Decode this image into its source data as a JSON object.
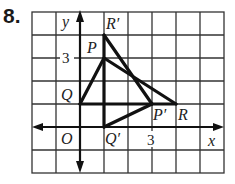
{
  "problem": {
    "number": "8."
  },
  "grid": {
    "x_min": -2,
    "x_max": 6,
    "y_min": -2,
    "y_max": 5,
    "origin_px": [
      80,
      127
    ],
    "unit_x_px": 24,
    "unit_y_px": 23
  },
  "axes": {
    "x_label": "x",
    "y_label": "y",
    "origin_label": "O",
    "x_tick_label": "3",
    "y_tick_label": "3"
  },
  "triangle_original": {
    "name": "PQR",
    "vertices": [
      {
        "label": "P",
        "x": 1,
        "y": 3
      },
      {
        "label": "Q",
        "x": 0,
        "y": 1
      },
      {
        "label": "R",
        "x": 4,
        "y": 1
      }
    ]
  },
  "triangle_image": {
    "name": "P'Q'R'",
    "vertices": [
      {
        "label": "P′",
        "x": 3,
        "y": 1
      },
      {
        "label": "Q′",
        "x": 1,
        "y": 0
      },
      {
        "label": "R′",
        "x": 1,
        "y": 4
      }
    ]
  },
  "colors": {
    "grid": "#333333",
    "lines": "#111111",
    "background": "#ffffff"
  }
}
